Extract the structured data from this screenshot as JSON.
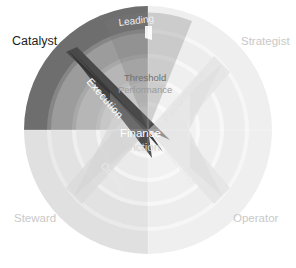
{
  "diagram": {
    "center": {
      "upper_line1": "Threshold",
      "upper_line2": "Performance",
      "main_line1": "Finance",
      "main_line2": "Function"
    },
    "quadrants": [
      {
        "id": "catalyst",
        "label": "Catalyst",
        "position": "top-left",
        "color": "#6e6e6e",
        "emphasis": "high"
      },
      {
        "id": "strategist",
        "label": "Strategist",
        "position": "top-right",
        "color": "#f2f2f2",
        "emphasis": "low"
      },
      {
        "id": "steward",
        "label": "Steward",
        "position": "bottom-left",
        "color": "#e3e3e3",
        "emphasis": "low"
      },
      {
        "id": "operator",
        "label": "Operator",
        "position": "bottom-right",
        "color": "#f2f2f2",
        "emphasis": "low"
      }
    ],
    "axes": [
      {
        "id": "leading",
        "label": "Leading",
        "position": "top-arc",
        "emphasis": "medium"
      },
      {
        "id": "execution",
        "label": "Execution",
        "position": "upper-left-spike",
        "emphasis": "high"
      },
      {
        "id": "performance",
        "label": "Performance",
        "position": "upper-right-spike",
        "emphasis": "low"
      },
      {
        "id": "control",
        "label": "Control",
        "position": "lower-left-spike",
        "emphasis": "low"
      },
      {
        "id": "efficiency",
        "label": "Efficiency",
        "position": "lower-right-spike",
        "emphasis": "low"
      }
    ],
    "colors": {
      "ring_dark": "#6e6e6e",
      "ring_dark_alt": "#7c7c7c",
      "ring_mid": "#b4b4b4",
      "ring_light": "#d8d8d8",
      "ring_pale": "#ececec",
      "ring_white": "#fafafa",
      "spike_dark": "#3a3a3a",
      "spike_light": "#e8e8e8",
      "background": "#ffffff",
      "text_dark": "#1d1d1d",
      "text_light": "#c9c9c9",
      "text_white": "#ffffff"
    },
    "ring_count": 4
  }
}
